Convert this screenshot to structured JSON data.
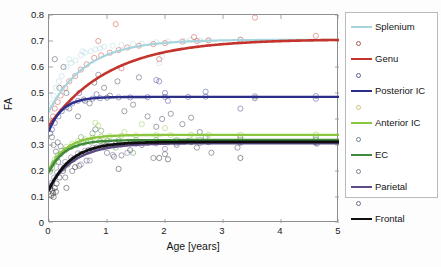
{
  "chart_data": {
    "type": "scatter",
    "title": "",
    "xlabel": "Age [years]",
    "ylabel": "FA",
    "xlim": [
      0,
      5
    ],
    "ylim": [
      0,
      0.8
    ],
    "xticks": [
      "0",
      "1",
      "2",
      "3",
      "4",
      "5"
    ],
    "xtick_values": [
      0,
      1,
      2,
      3,
      4,
      5
    ],
    "yticks": [
      "0",
      "0.1",
      "0.2",
      "0.3",
      "0.4",
      "0.5",
      "0.6",
      "0.7",
      "0.8"
    ],
    "ytick_values": [
      0,
      0.1,
      0.2,
      0.3,
      0.4,
      0.5,
      0.6,
      0.7,
      0.8
    ],
    "grid": false,
    "legend_position": "right-outside",
    "marker_style": "open-circle",
    "series": [
      {
        "name": "Splenium",
        "color": "#a8d5dd",
        "fit": {
          "y0": 0.43,
          "asymptote": 0.705,
          "rate": 1.55
        },
        "points": [
          [
            0.02,
            0.435
          ],
          [
            0.05,
            0.46
          ],
          [
            0.08,
            0.49
          ],
          [
            0.12,
            0.52
          ],
          [
            0.17,
            0.545
          ],
          [
            0.22,
            0.565
          ],
          [
            0.3,
            0.6
          ],
          [
            0.38,
            0.615
          ],
          [
            0.46,
            0.625
          ],
          [
            0.55,
            0.645
          ],
          [
            0.62,
            0.655
          ],
          [
            0.72,
            0.66
          ],
          [
            0.8,
            0.668
          ],
          [
            0.88,
            0.672
          ],
          [
            0.95,
            0.678
          ],
          [
            1.1,
            0.682
          ],
          [
            1.25,
            0.685
          ],
          [
            1.45,
            0.688
          ],
          [
            1.6,
            0.69
          ],
          [
            1.85,
            0.695
          ],
          [
            2.05,
            0.698
          ],
          [
            2.35,
            0.7
          ],
          [
            2.6,
            0.702
          ],
          [
            2.75,
            0.703
          ],
          [
            3.3,
            0.705
          ],
          [
            0.35,
            0.63
          ],
          [
            0.58,
            0.66
          ],
          [
            1.9,
            0.615
          ],
          [
            1.95,
            0.64
          ],
          [
            2.45,
            0.705
          ]
        ]
      },
      {
        "name": "Genu",
        "color": "#c4342c",
        "fit": {
          "y0": 0.375,
          "asymptote": 0.707,
          "rate": 0.95
        },
        "points": [
          [
            0.03,
            0.385
          ],
          [
            0.07,
            0.41
          ],
          [
            0.1,
            0.44
          ],
          [
            0.15,
            0.465
          ],
          [
            0.2,
            0.49
          ],
          [
            0.28,
            0.52
          ],
          [
            0.35,
            0.545
          ],
          [
            0.45,
            0.565
          ],
          [
            0.55,
            0.59
          ],
          [
            0.65,
            0.61
          ],
          [
            0.78,
            0.635
          ],
          [
            0.9,
            0.645
          ],
          [
            1.05,
            0.655
          ],
          [
            1.2,
            0.665
          ],
          [
            1.35,
            0.675
          ],
          [
            1.55,
            0.682
          ],
          [
            1.8,
            0.688
          ],
          [
            2.0,
            0.692
          ],
          [
            2.3,
            0.698
          ],
          [
            2.55,
            0.7
          ],
          [
            2.75,
            0.702
          ],
          [
            3.3,
            0.705
          ],
          [
            3.55,
            0.79
          ],
          [
            4.6,
            0.72
          ],
          [
            0.85,
            0.7
          ],
          [
            1.15,
            0.765
          ],
          [
            1.25,
            0.595
          ],
          [
            1.9,
            0.63
          ],
          [
            2.5,
            0.715
          ]
        ]
      },
      {
        "name": "Posterior IC",
        "color": "#2b2f87",
        "fit": {
          "y0": 0.355,
          "asymptote": 0.485,
          "rate": 4.2
        },
        "points": [
          [
            0.02,
            0.345
          ],
          [
            0.05,
            0.36
          ],
          [
            0.1,
            0.385
          ],
          [
            0.16,
            0.41
          ],
          [
            0.22,
            0.43
          ],
          [
            0.3,
            0.445
          ],
          [
            0.4,
            0.46
          ],
          [
            0.5,
            0.47
          ],
          [
            0.6,
            0.475
          ],
          [
            0.75,
            0.478
          ],
          [
            0.88,
            0.48
          ],
          [
            1.0,
            0.482
          ],
          [
            1.2,
            0.483
          ],
          [
            1.4,
            0.483
          ],
          [
            1.7,
            0.484
          ],
          [
            2.0,
            0.485
          ],
          [
            2.4,
            0.485
          ],
          [
            2.7,
            0.486
          ],
          [
            3.55,
            0.487
          ],
          [
            4.6,
            0.488
          ],
          [
            0.52,
            0.5
          ],
          [
            0.82,
            0.495
          ],
          [
            1.85,
            0.55
          ],
          [
            1.9,
            0.545
          ],
          [
            2.0,
            0.5
          ],
          [
            2.05,
            0.47
          ],
          [
            2.7,
            0.505
          ],
          [
            4.6,
            0.478
          ],
          [
            3.3,
            0.44
          ]
        ]
      },
      {
        "name": "Anterior IC",
        "color": "#8cc63e",
        "fit": {
          "y0": 0.205,
          "asymptote": 0.339,
          "rate": 3.2
        },
        "points": [
          [
            0.02,
            0.205
          ],
          [
            0.06,
            0.225
          ],
          [
            0.1,
            0.245
          ],
          [
            0.15,
            0.262
          ],
          [
            0.22,
            0.278
          ],
          [
            0.3,
            0.293
          ],
          [
            0.4,
            0.305
          ],
          [
            0.5,
            0.315
          ],
          [
            0.62,
            0.322
          ],
          [
            0.75,
            0.328
          ],
          [
            0.9,
            0.332
          ],
          [
            1.05,
            0.334
          ],
          [
            1.25,
            0.336
          ],
          [
            1.5,
            0.337
          ],
          [
            1.85,
            0.338
          ],
          [
            2.1,
            0.338
          ],
          [
            2.45,
            0.339
          ],
          [
            2.75,
            0.339
          ],
          [
            3.3,
            0.339
          ],
          [
            4.6,
            0.34
          ],
          [
            0.8,
            0.385
          ],
          [
            0.85,
            0.375
          ],
          [
            1.3,
            0.35
          ],
          [
            1.6,
            0.38
          ],
          [
            2.0,
            0.365
          ],
          [
            2.5,
            0.33
          ],
          [
            0.95,
            0.3
          ]
        ]
      },
      {
        "name": "EC",
        "color": "#3f8a3a",
        "fit": {
          "y0": 0.197,
          "asymptote": 0.319,
          "rate": 3.6
        },
        "points": [
          [
            0.02,
            0.198
          ],
          [
            0.05,
            0.212
          ],
          [
            0.09,
            0.232
          ],
          [
            0.14,
            0.25
          ],
          [
            0.2,
            0.265
          ],
          [
            0.28,
            0.28
          ],
          [
            0.38,
            0.292
          ],
          [
            0.48,
            0.3
          ],
          [
            0.6,
            0.308
          ],
          [
            0.72,
            0.312
          ],
          [
            0.88,
            0.315
          ],
          [
            1.0,
            0.317
          ],
          [
            1.2,
            0.318
          ],
          [
            1.5,
            0.319
          ],
          [
            1.85,
            0.319
          ],
          [
            2.2,
            0.319
          ],
          [
            2.6,
            0.32
          ],
          [
            3.3,
            0.32
          ],
          [
            4.6,
            0.32
          ],
          [
            0.55,
            0.33
          ],
          [
            0.75,
            0.345
          ],
          [
            0.9,
            0.355
          ],
          [
            1.15,
            0.29
          ],
          [
            1.45,
            0.27
          ]
        ]
      },
      {
        "name": "Parietal",
        "color": "#5e4c87",
        "fit": {
          "y0": 0.135,
          "asymptote": 0.307,
          "rate": 2.2
        },
        "points": [
          [
            0.02,
            0.14
          ],
          [
            0.05,
            0.155
          ],
          [
            0.09,
            0.175
          ],
          [
            0.14,
            0.195
          ],
          [
            0.2,
            0.215
          ],
          [
            0.28,
            0.235
          ],
          [
            0.38,
            0.252
          ],
          [
            0.5,
            0.268
          ],
          [
            0.62,
            0.278
          ],
          [
            0.75,
            0.288
          ],
          [
            0.9,
            0.294
          ],
          [
            1.05,
            0.298
          ],
          [
            1.25,
            0.302
          ],
          [
            1.5,
            0.304
          ],
          [
            1.85,
            0.306
          ],
          [
            2.2,
            0.307
          ],
          [
            2.6,
            0.307
          ],
          [
            3.3,
            0.308
          ],
          [
            4.6,
            0.308
          ],
          [
            0.55,
            0.225
          ],
          [
            0.7,
            0.24
          ],
          [
            1.1,
            0.262
          ],
          [
            1.35,
            0.27
          ],
          [
            2.0,
            0.285
          ]
        ]
      },
      {
        "name": "Frontal",
        "color": "#0f0f0f",
        "fit": {
          "y0": 0.128,
          "asymptote": 0.312,
          "rate": 2.6
        },
        "points": [
          [
            0.02,
            0.13
          ],
          [
            0.04,
            0.105
          ],
          [
            0.07,
            0.115
          ],
          [
            0.1,
            0.135
          ],
          [
            0.13,
            0.152
          ],
          [
            0.18,
            0.175
          ],
          [
            0.24,
            0.2
          ],
          [
            0.32,
            0.225
          ],
          [
            0.42,
            0.245
          ],
          [
            0.55,
            0.265
          ],
          [
            0.68,
            0.28
          ],
          [
            0.82,
            0.29
          ],
          [
            0.98,
            0.298
          ],
          [
            1.15,
            0.303
          ],
          [
            1.4,
            0.307
          ],
          [
            1.7,
            0.309
          ],
          [
            2.05,
            0.31
          ],
          [
            2.45,
            0.311
          ],
          [
            2.75,
            0.311
          ],
          [
            3.3,
            0.312
          ],
          [
            4.6,
            0.312
          ],
          [
            0.08,
            0.1
          ],
          [
            0.12,
            0.12
          ],
          [
            0.3,
            0.135
          ],
          [
            1.2,
            0.208
          ],
          [
            1.9,
            0.25
          ],
          [
            2.05,
            0.245
          ],
          [
            3.3,
            0.25
          ],
          [
            0.45,
            0.215
          ]
        ]
      }
    ],
    "extra_scatter": [
      [
        0.1,
        0.63
      ],
      [
        0.18,
        0.52
      ],
      [
        0.25,
        0.6
      ],
      [
        0.3,
        0.5
      ],
      [
        0.35,
        0.44
      ],
      [
        0.5,
        0.41
      ],
      [
        0.62,
        0.47
      ],
      [
        0.7,
        0.46
      ],
      [
        0.78,
        0.54
      ],
      [
        0.85,
        0.57
      ],
      [
        0.95,
        0.52
      ],
      [
        1.05,
        0.49
      ],
      [
        1.18,
        0.545
      ],
      [
        1.3,
        0.43
      ],
      [
        1.45,
        0.455
      ],
      [
        1.55,
        0.56
      ],
      [
        1.7,
        0.41
      ],
      [
        1.85,
        0.37
      ],
      [
        1.95,
        0.4
      ],
      [
        2.1,
        0.42
      ],
      [
        2.3,
        0.38
      ],
      [
        2.45,
        0.405
      ],
      [
        2.6,
        0.35
      ],
      [
        2.7,
        0.33
      ],
      [
        3.25,
        0.29
      ],
      [
        3.3,
        0.33
      ],
      [
        3.55,
        0.48
      ],
      [
        4.6,
        0.33
      ],
      [
        4.62,
        0.305
      ],
      [
        0.15,
        0.31
      ],
      [
        0.2,
        0.295
      ],
      [
        0.25,
        0.21
      ],
      [
        0.4,
        0.2
      ],
      [
        0.52,
        0.22
      ],
      [
        0.65,
        0.24
      ],
      [
        0.8,
        0.36
      ],
      [
        1.0,
        0.27
      ],
      [
        1.12,
        0.255
      ],
      [
        1.25,
        0.26
      ],
      [
        1.4,
        0.28
      ],
      [
        1.6,
        0.3
      ],
      [
        1.8,
        0.25
      ],
      [
        2.0,
        0.265
      ],
      [
        2.2,
        0.3
      ],
      [
        2.4,
        0.315
      ],
      [
        2.55,
        0.29
      ],
      [
        2.8,
        0.27
      ],
      [
        0.05,
        0.33
      ],
      [
        0.08,
        0.3
      ],
      [
        0.12,
        0.275
      ],
      [
        0.16,
        0.235
      ],
      [
        0.28,
        0.175
      ],
      [
        0.06,
        0.125
      ]
    ]
  },
  "legend": {
    "items": [
      {
        "label": "Splenium",
        "color": "#a8d5dd",
        "width": 2.2
      },
      {
        "label": "Genu",
        "color": "#c4342c",
        "width": 2.6
      },
      {
        "label": "Posterior IC",
        "color": "#2b2f87",
        "width": 2.4
      },
      {
        "label": "Anterior IC",
        "color": "#8cc63e",
        "width": 2.4
      },
      {
        "label": "EC",
        "color": "#3f8a3a",
        "width": 2.4
      },
      {
        "label": "Parietal",
        "color": "#5e4c87",
        "width": 2.4
      },
      {
        "label": "Frontal",
        "color": "#0f0f0f",
        "width": 2.8
      }
    ],
    "marker_colors": [
      "#b05a50",
      "#5a5f92",
      "#cfc37a",
      "#6f7f92",
      "#7f7f8f",
      "#6f6f84"
    ]
  }
}
